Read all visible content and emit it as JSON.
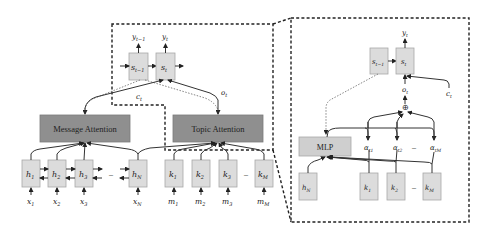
{
  "figure": {
    "left_panel": {
      "decoder": {
        "prev_state": {
          "symbol": "s",
          "sub": "t−1",
          "output": "y",
          "output_sub": "t−1"
        },
        "curr_state": {
          "symbol": "s",
          "sub": "t",
          "output": "y",
          "output_sub": "t"
        },
        "context_label": {
          "symbol": "c",
          "sub": "t"
        },
        "topic_label": {
          "symbol": "o",
          "sub": "t"
        }
      },
      "message_attention": {
        "label": "Message Attention"
      },
      "topic_attention": {
        "label": "Topic Attention"
      },
      "encoder_states": [
        {
          "symbol": "h",
          "sub": "1",
          "input": "x",
          "input_sub": "1"
        },
        {
          "symbol": "h",
          "sub": "2",
          "input": "x",
          "input_sub": "2"
        },
        {
          "symbol": "h",
          "sub": "3",
          "input": "x",
          "input_sub": "3"
        },
        {
          "symbol": "h",
          "sub": "N",
          "input": "x",
          "input_sub": "N"
        }
      ],
      "topic_states": [
        {
          "symbol": "k",
          "sub": "1",
          "input": "m",
          "input_sub": "1"
        },
        {
          "symbol": "k",
          "sub": "2",
          "input": "m",
          "input_sub": "2"
        },
        {
          "symbol": "k",
          "sub": "3",
          "input": "m",
          "input_sub": "3"
        },
        {
          "symbol": "k",
          "sub": "M",
          "input": "m",
          "input_sub": "M"
        }
      ],
      "ellipsis": "–"
    },
    "right_panel": {
      "prev_state": {
        "symbol": "s",
        "sub": "t−1"
      },
      "curr_state": {
        "symbol": "s",
        "sub": "t",
        "output": "y",
        "output_sub": "t"
      },
      "topic_vector": {
        "symbol": "o",
        "sub": "t"
      },
      "context": {
        "symbol": "c",
        "sub": "t"
      },
      "sum_operator": "⊕",
      "mlp": {
        "label": "MLP"
      },
      "weights": [
        {
          "symbol": "α",
          "sub": "t1"
        },
        {
          "symbol": "α",
          "sub": "t2"
        },
        {
          "symbol": "α",
          "sub": "tM"
        }
      ],
      "encoder_last": {
        "symbol": "h",
        "sub": "N"
      },
      "topic_states": [
        {
          "symbol": "k",
          "sub": "1"
        },
        {
          "symbol": "k",
          "sub": "2"
        },
        {
          "symbol": "k",
          "sub": "M"
        }
      ],
      "ellipsis": "–"
    }
  }
}
